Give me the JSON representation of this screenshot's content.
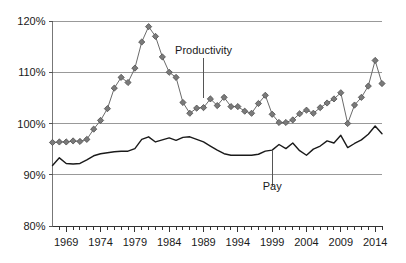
{
  "chart_data": {
    "type": "line",
    "title": "",
    "subtitle": "",
    "xlabel": "",
    "ylabel": "",
    "xlim": [
      1967,
      2015
    ],
    "ylim": [
      80,
      120
    ],
    "yticks": [
      "80%",
      "90%",
      "100%",
      "110%",
      "120%"
    ],
    "ytick_values": [
      80,
      90,
      100,
      110,
      120
    ],
    "xticks": [
      "1969",
      "1974",
      "1979",
      "1984",
      "1989",
      "1994",
      "1999",
      "2004",
      "2009",
      "2014"
    ],
    "xtick_values": [
      1969,
      1974,
      1979,
      1984,
      1989,
      1994,
      1999,
      2004,
      2009,
      2014
    ],
    "grid": true,
    "grid_axis": "y",
    "legend": "annotations",
    "annotations": [
      {
        "text": "Productivity",
        "x": 1989,
        "y": 113.5,
        "leader_to_y": 105.0
      },
      {
        "text": "Pay",
        "x": 1999,
        "y": 87.0,
        "leader_to_y": 94.8
      }
    ],
    "x": [
      1967,
      1968,
      1969,
      1970,
      1971,
      1972,
      1973,
      1974,
      1975,
      1976,
      1977,
      1978,
      1979,
      1980,
      1981,
      1982,
      1983,
      1984,
      1985,
      1986,
      1987,
      1988,
      1989,
      1990,
      1991,
      1992,
      1993,
      1994,
      1995,
      1996,
      1997,
      1998,
      1999,
      2000,
      2001,
      2002,
      2003,
      2004,
      2005,
      2006,
      2007,
      2008,
      2009,
      2010,
      2011,
      2012,
      2013,
      2014,
      2015
    ],
    "series": [
      {
        "name": "Productivity",
        "color": "#6b6b6b",
        "marker": "diamond",
        "values": [
          96.3,
          96.4,
          96.4,
          96.6,
          96.5,
          96.9,
          98.9,
          100.6,
          102.9,
          106.9,
          109.0,
          108.0,
          110.8,
          115.9,
          118.9,
          117.0,
          113.0,
          110.0,
          109.0,
          104.1,
          102.0,
          103.0,
          103.1,
          104.8,
          103.5,
          105.1,
          103.3,
          103.3,
          102.4,
          102.0,
          103.9,
          105.5,
          101.8,
          100.2,
          100.2,
          100.7,
          101.9,
          102.6,
          102.0,
          103.1,
          104.0,
          104.8,
          106.0,
          100.0,
          103.6,
          105.1,
          107.3,
          112.3,
          107.8
        ]
      },
      {
        "name": "Pay",
        "color": "#1a1a1a",
        "marker": "none",
        "values": [
          91.8,
          93.3,
          92.2,
          92.1,
          92.2,
          92.9,
          93.7,
          94.1,
          94.3,
          94.5,
          94.6,
          94.6,
          95.1,
          96.9,
          97.4,
          96.4,
          96.8,
          97.2,
          96.7,
          97.3,
          97.4,
          96.9,
          96.4,
          95.6,
          94.8,
          94.1,
          93.8,
          93.8,
          93.8,
          93.8,
          94.0,
          94.6,
          94.8,
          95.9,
          95.1,
          96.2,
          94.7,
          93.8,
          95.0,
          95.6,
          96.6,
          96.2,
          97.7,
          95.3,
          96.1,
          96.8,
          97.9,
          99.5,
          98.0
        ]
      }
    ]
  },
  "axes": {
    "y_axis_name": "percent-axis",
    "x_axis_name": "year-axis"
  }
}
